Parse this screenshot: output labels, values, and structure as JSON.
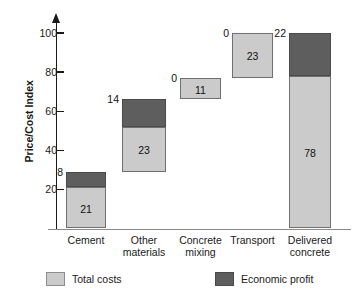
{
  "chart_data": {
    "type": "bar",
    "subtype": "waterfall-stacked",
    "title": "",
    "xlabel": "",
    "ylabel": "Price/Cost Index",
    "ylim": [
      0,
      108
    ],
    "yticks": [
      20,
      40,
      60,
      80,
      100
    ],
    "ytick_labels": [
      "20",
      "40",
      "60",
      "80",
      "100"
    ],
    "grid": false,
    "legend_position": "bottom",
    "categories": [
      "Cement",
      "Other materials",
      "Concrete mixing",
      "Transport",
      "Delivered concrete"
    ],
    "category_lines": [
      [
        "Cement"
      ],
      [
        "Other",
        "materials"
      ],
      [
        "Concrete",
        "mixing"
      ],
      [
        "Transport"
      ],
      [
        "Delivered",
        "concrete"
      ]
    ],
    "series": [
      {
        "name": "Total costs",
        "color": "#cbcbcb",
        "values": [
          21,
          23,
          11,
          23,
          78
        ]
      },
      {
        "name": "Economic profit",
        "color": "#5e5e5e",
        "values": [
          8,
          14,
          0,
          0,
          22
        ]
      }
    ],
    "bases": [
      0,
      29,
      66,
      77,
      0
    ],
    "bar_totals": [
      29,
      37,
      11,
      23,
      100
    ],
    "bars": [
      {
        "category": "Cement",
        "base": 0,
        "costs": 21,
        "profit": 8,
        "costs_label": "21",
        "profit_label": "8",
        "profit_label_placement": "outside-left"
      },
      {
        "category": "Other materials",
        "base": 29,
        "costs": 23,
        "profit": 14,
        "costs_label": "23",
        "profit_label": "14",
        "profit_label_placement": "outside-left"
      },
      {
        "category": "Concrete mixing",
        "base": 66,
        "costs": 11,
        "profit": 0,
        "costs_label": "11",
        "profit_label": "0",
        "profit_label_placement": "outside-left"
      },
      {
        "category": "Transport",
        "base": 77,
        "costs": 23,
        "profit": 0,
        "costs_label": "23",
        "profit_label": "0",
        "profit_label_placement": "outside-left"
      },
      {
        "category": "Delivered concrete",
        "base": 0,
        "costs": 78,
        "profit": 22,
        "costs_label": "78",
        "profit_label": "22",
        "profit_label_placement": "outside-left"
      }
    ],
    "legend": [
      {
        "label": "Total costs",
        "color": "#cbcbcb"
      },
      {
        "label": "Economic profit",
        "color": "#5e5e5e"
      }
    ]
  },
  "colors": {
    "total_costs": "#cbcbcb",
    "economic_profit": "#5e5e5e",
    "axis": "#1a1a1a",
    "baseline": "#8a8a8a",
    "background": "#ffffff"
  }
}
